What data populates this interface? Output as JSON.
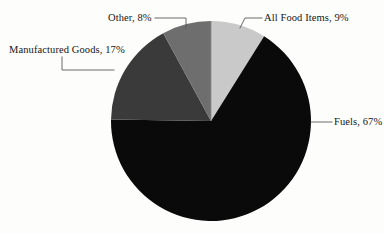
{
  "chart_data": {
    "type": "pie",
    "title": "",
    "categories": [
      "All Food Items",
      "Fuels",
      "Manufactured Goods",
      "Other"
    ],
    "values": [
      9,
      67,
      17,
      8
    ],
    "unit": "%",
    "labels": [
      "All Food Items, 9%",
      "Fuels, 67%",
      "Manufactured Goods, 17%",
      "Other, 8%"
    ],
    "slice_colors": [
      "#c9c9c9",
      "#0a0a0a",
      "#3a3a3a",
      "#6e6e6e"
    ],
    "start_angle_deg": 0,
    "direction": "clockwise",
    "legend": "none",
    "labels_position": "outside-with-leader-lines",
    "grid": false,
    "background_color": "#fdfdfc",
    "leader_line_color": "#5a5a5a",
    "text_color": "#151515"
  },
  "slices": {
    "all_food_items": {
      "name": "All Food Items",
      "label": "All Food Items, 9%",
      "value": 9,
      "color": "#c9c9c9"
    },
    "fuels": {
      "name": "Fuels",
      "label": "Fuels, 67%",
      "value": 67,
      "color": "#0a0a0a"
    },
    "manufactured_goods": {
      "name": "Manufactured Goods",
      "label": "Manufactured Goods, 17%",
      "value": 17,
      "color": "#3a3a3a"
    },
    "other": {
      "name": "Other",
      "label": "Other, 8%",
      "value": 8,
      "color": "#6e6e6e"
    }
  },
  "geometry": {
    "center_x": 211,
    "center_y": 121,
    "radius": 100
  }
}
